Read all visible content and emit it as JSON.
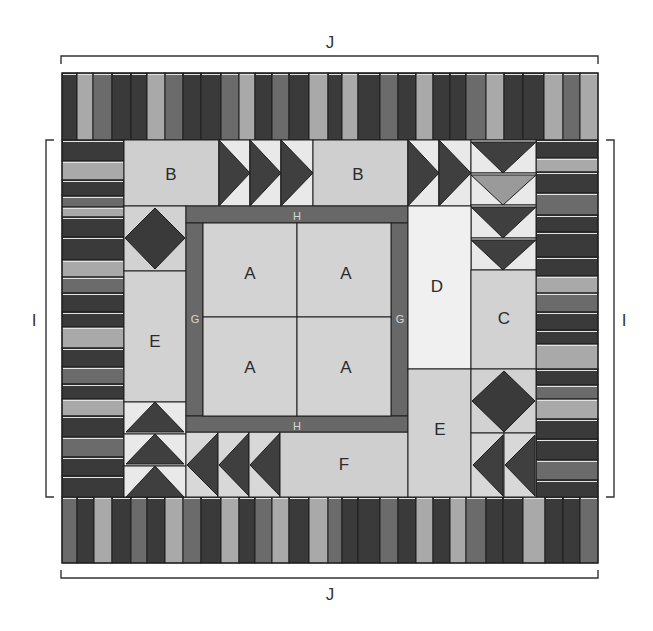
{
  "colors": {
    "dark": "#3a3a3a",
    "medium": "#6b6b6b",
    "light": "#a9a9a9",
    "patch_light": "#d2d2d2",
    "patch_lighter": "#e6e6e6",
    "patch_white": "#f2f2f2",
    "sashing": "#686868",
    "outline": "#1e1e1e",
    "triangle_bg": "#e9e9e9",
    "triangle_mid": "#9a9a9a"
  },
  "dimension_labels": {
    "top": "J",
    "bottom": "J",
    "left": "I",
    "right": "I"
  },
  "patches": [
    {
      "id": "A",
      "label": "A",
      "position": "center-top-left"
    },
    {
      "id": "A",
      "label": "A",
      "position": "center-top-right"
    },
    {
      "id": "A",
      "label": "A",
      "position": "center-bottom-left"
    },
    {
      "id": "A",
      "label": "A",
      "position": "center-bottom-right"
    },
    {
      "id": "B",
      "label": "B",
      "position": "top-left"
    },
    {
      "id": "B",
      "label": "B",
      "position": "top-center"
    },
    {
      "id": "C",
      "label": "C",
      "position": "right"
    },
    {
      "id": "D",
      "label": "D",
      "position": "right-of-center"
    },
    {
      "id": "E",
      "label": "E",
      "position": "left"
    },
    {
      "id": "E",
      "label": "E",
      "position": "bottom-right-of-center"
    },
    {
      "id": "F",
      "label": "F",
      "position": "bottom-center"
    },
    {
      "id": "G",
      "label": "G",
      "position": "left sashing"
    },
    {
      "id": "G",
      "label": "G",
      "position": "right sashing"
    },
    {
      "id": "H",
      "label": "H",
      "position": "top sashing"
    },
    {
      "id": "H",
      "label": "H",
      "position": "bottom sashing"
    }
  ],
  "labels": {
    "a1": "A",
    "a2": "A",
    "a3": "A",
    "a4": "A",
    "b1": "B",
    "b2": "B",
    "c": "C",
    "d": "D",
    "e1": "E",
    "e2": "E",
    "f": "F",
    "g1": "G",
    "g2": "G",
    "h1": "H",
    "h2": "H"
  },
  "borders": {
    "top_stripes": {
      "edges": [
        62,
        77,
        93,
        112,
        131,
        147,
        165,
        183,
        201,
        221,
        239,
        255,
        272,
        289,
        309,
        328,
        342,
        358,
        380,
        398,
        416,
        433,
        450,
        466,
        486,
        504,
        523,
        544,
        563,
        580,
        598
      ],
      "tones": [
        "d",
        "l",
        "m",
        "d",
        "d",
        "l",
        "m",
        "d",
        "d",
        "m",
        "l",
        "d",
        "m",
        "d",
        "l",
        "d",
        "l",
        "d",
        "m",
        "d",
        "l",
        "d",
        "d",
        "m",
        "l",
        "d",
        "d",
        "l",
        "m",
        "l"
      ]
    },
    "bottom_stripes": {
      "edges": [
        62,
        77,
        94,
        112,
        131,
        147,
        165,
        183,
        201,
        221,
        239,
        255,
        272,
        289,
        309,
        328,
        342,
        358,
        380,
        398,
        416,
        433,
        450,
        466,
        486,
        503,
        523,
        545,
        563,
        580,
        598
      ],
      "tones": [
        "m",
        "d",
        "l",
        "d",
        "m",
        "d",
        "l",
        "m",
        "d",
        "l",
        "d",
        "m",
        "l",
        "d",
        "l",
        "m",
        "d",
        "d",
        "m",
        "d",
        "l",
        "d",
        "l",
        "m",
        "d",
        "d",
        "l",
        "d",
        "d",
        "m"
      ]
    },
    "left_rows": {
      "edges": [
        140,
        161,
        180,
        196,
        207,
        217,
        237,
        260,
        277,
        293,
        312,
        327,
        348,
        367,
        384,
        399,
        416,
        437,
        457,
        476,
        497
      ],
      "tones": [
        "d",
        "l",
        "d",
        "m",
        "l",
        "d",
        "d",
        "l",
        "m",
        "d",
        "d",
        "l",
        "d",
        "m",
        "d",
        "l",
        "d",
        "m",
        "d",
        "d"
      ]
    },
    "right_rows": {
      "edges": [
        140,
        158,
        172,
        193,
        215,
        232,
        257,
        276,
        293,
        312,
        330,
        344,
        369,
        385,
        399,
        419,
        439,
        460,
        480,
        497
      ],
      "tones": [
        "d",
        "l",
        "d",
        "m",
        "d",
        "d",
        "d",
        "l",
        "m",
        "d",
        "d",
        "l",
        "d",
        "m",
        "l",
        "d",
        "d",
        "m",
        "d"
      ]
    }
  }
}
